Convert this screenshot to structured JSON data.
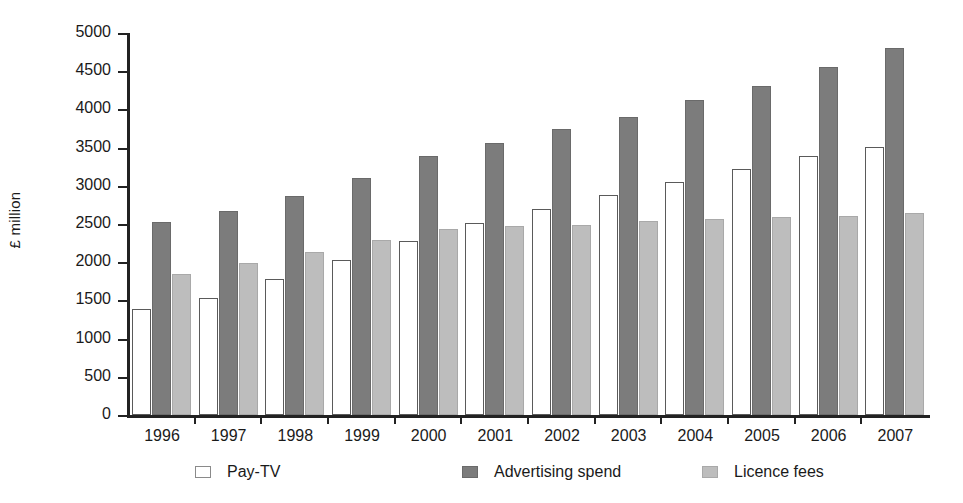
{
  "chart_data": {
    "type": "bar",
    "title": "",
    "subtitle": "",
    "xlabel": "",
    "ylabel": "£ million",
    "ylim": [
      0,
      5000
    ],
    "ytick_step": 500,
    "yticks": [
      0,
      500,
      1000,
      1500,
      2000,
      2500,
      3000,
      3500,
      4000,
      4500,
      5000
    ],
    "ytick_labels": [
      "0",
      "500",
      "1000",
      "1500",
      "2000",
      "2500",
      "3000",
      "3500",
      "4000",
      "4500",
      "5000"
    ],
    "grid": false,
    "legend_position": "bottom",
    "categories": [
      "1996",
      "1997",
      "1998",
      "1999",
      "2000",
      "2001",
      "2002",
      "2003",
      "2004",
      "2005",
      "2006",
      "2007"
    ],
    "series": [
      {
        "name": "Pay-TV",
        "color": "#ffffff",
        "edge_color": "#5a5a5a",
        "values": [
          1390,
          1530,
          1780,
          2030,
          2280,
          2510,
          2700,
          2880,
          3050,
          3220,
          3390,
          3510
        ]
      },
      {
        "name": "Advertising spend",
        "color": "#7c7c7c",
        "edge_color": "#6a6a6a",
        "values": [
          2520,
          2670,
          2870,
          3100,
          3390,
          3560,
          3740,
          3900,
          4120,
          4310,
          4550,
          4800
        ]
      },
      {
        "name": "Licence fees",
        "color": "#bdbdbd",
        "edge_color": "#a9a9a9",
        "values": [
          1840,
          1990,
          2130,
          2290,
          2440,
          2470,
          2490,
          2540,
          2560,
          2590,
          2610,
          2650
        ]
      }
    ]
  },
  "legend": {
    "items": [
      {
        "label": "Pay-TV",
        "swatch": "white-square-swatch"
      },
      {
        "label": "Advertising spend",
        "swatch": "dark-gray-square-swatch"
      },
      {
        "label": "Licence fees",
        "swatch": "light-gray-square-swatch"
      }
    ]
  },
  "colors": {
    "pay_tv": "#ffffff",
    "advertising_spend": "#7c7c7c",
    "licence_fees": "#bdbdbd",
    "axis": "#222222",
    "text": "#1a1a1a",
    "background": "#ffffff"
  }
}
